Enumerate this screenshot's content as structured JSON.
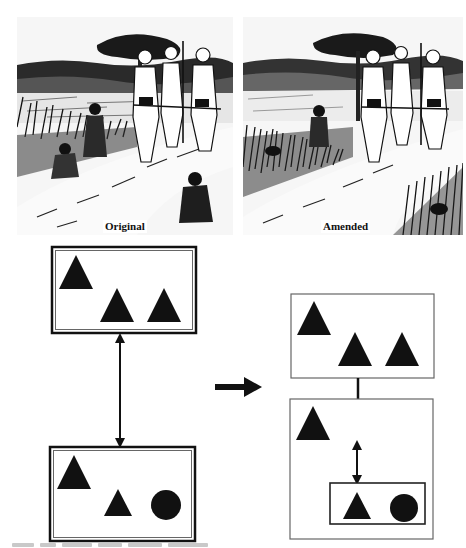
{
  "figure": {
    "illustrations": [
      {
        "id": "original",
        "label": "Original",
        "description": "Ink drawing: three uniformed soldiers with spears walk along a dirt path through a rice field; villagers crouch visibly in the grass beside the path.",
        "box": {
          "x": 17,
          "y": 17,
          "w": 216,
          "h": 218
        }
      },
      {
        "id": "amended",
        "label": "Amended",
        "description": "Same scene amended: the villagers are now mostly hidden in the tall grass, only their heads visible.",
        "box": {
          "x": 243,
          "y": 17,
          "w": 220,
          "h": 218
        }
      }
    ],
    "left_diagram": {
      "top_box": {
        "border": "double",
        "box": {
          "x": 52,
          "y": 247,
          "w": 144,
          "h": 86
        },
        "shapes": [
          {
            "type": "triangle",
            "cx": 76,
            "cy": 272,
            "size": 34
          },
          {
            "type": "triangle",
            "cx": 117,
            "cy": 305,
            "size": 34
          },
          {
            "type": "triangle",
            "cx": 164,
            "cy": 305,
            "size": 34
          }
        ]
      },
      "connector": {
        "type": "double-arrow",
        "x": 120,
        "y1": 334,
        "y2": 447
      },
      "bottom_box": {
        "border": "double",
        "box": {
          "x": 50,
          "y": 447,
          "w": 145,
          "h": 94
        },
        "shapes": [
          {
            "type": "triangle",
            "cx": 74,
            "cy": 472,
            "size": 34
          },
          {
            "type": "triangle",
            "cx": 118,
            "cy": 502,
            "size": 27
          },
          {
            "type": "circle",
            "cx": 166,
            "cy": 505,
            "r": 15
          }
        ]
      }
    },
    "transform_arrow": {
      "x1": 215,
      "x2": 262,
      "y": 387
    },
    "right_diagram": {
      "top_box": {
        "border": "single",
        "box": {
          "x": 291,
          "y": 294,
          "w": 143,
          "h": 84
        },
        "shapes": [
          {
            "type": "triangle",
            "cx": 314,
            "cy": 318,
            "size": 34
          },
          {
            "type": "triangle",
            "cx": 355,
            "cy": 349,
            "size": 34
          },
          {
            "type": "triangle",
            "cx": 402,
            "cy": 349,
            "size": 34
          }
        ]
      },
      "connector": {
        "type": "line",
        "x": 358,
        "y1": 378,
        "y2": 399
      },
      "bottom_box": {
        "border": "single",
        "box": {
          "x": 290,
          "y": 399,
          "w": 143,
          "h": 140
        },
        "shapes": [
          {
            "type": "triangle",
            "cx": 313,
            "cy": 423,
            "size": 34
          }
        ],
        "inner_connector": {
          "type": "double-arrow",
          "x": 357,
          "y1": 442,
          "y2": 483
        },
        "inner_box": {
          "border": "single-thick",
          "box": {
            "x": 330,
            "y": 483,
            "w": 95,
            "h": 41
          },
          "shapes": [
            {
              "type": "triangle",
              "cx": 357,
              "cy": 505,
              "size": 27
            },
            {
              "type": "circle",
              "cx": 404,
              "cy": 508,
              "r": 14
            }
          ]
        }
      }
    },
    "caption": {
      "visible": "partial",
      "note": "Caption line cut off at bottom edge; text not legible"
    }
  },
  "colors": {
    "ink": "#111111",
    "box_border": "#555555",
    "background": "#ffffff"
  }
}
